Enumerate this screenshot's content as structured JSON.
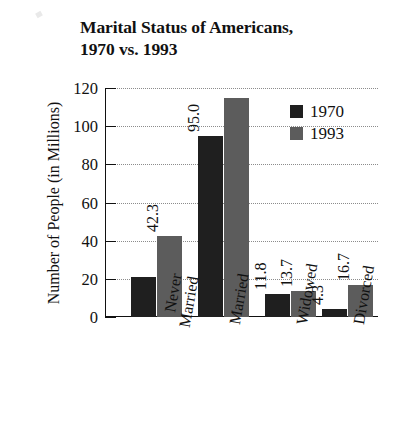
{
  "chart_data": {
    "type": "bar",
    "title": "Marital Status of Americans, 1970 vs. 1993",
    "title_lines": [
      "Marital Status of Americans,",
      "1970 vs. 1993"
    ],
    "xlabel": "",
    "ylabel": "Number of People (in Millions)",
    "ylim": [
      0,
      120
    ],
    "yticks": [
      0,
      20,
      40,
      60,
      80,
      100,
      120
    ],
    "ytick_labels": [
      "0",
      "20",
      "40",
      "60",
      "80",
      "100",
      "120"
    ],
    "grid": true,
    "legend_position": "upper right",
    "categories": [
      "Never Married",
      "Married",
      "Widowed",
      "Divorced"
    ],
    "category_lines": [
      [
        "Never",
        "Married"
      ],
      [
        "Married"
      ],
      [
        "Widowed"
      ],
      [
        "Divorced"
      ]
    ],
    "series": [
      {
        "name": "1970",
        "color": "#1f1f1f",
        "values": [
          21.0,
          95.0,
          11.8,
          4.3
        ],
        "labels": [
          "",
          "95.0",
          "11.8",
          "4.3"
        ]
      },
      {
        "name": "1993",
        "color": "#5c5c5c",
        "values": [
          42.3,
          115.0,
          13.7,
          16.7
        ],
        "labels": [
          "42.3",
          "",
          "13.7",
          "16.7"
        ]
      }
    ]
  }
}
